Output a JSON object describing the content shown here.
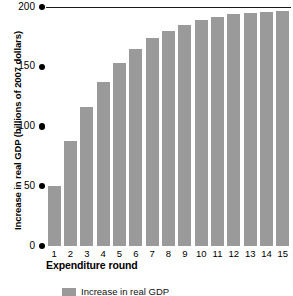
{
  "chart_data": {
    "type": "bar",
    "title": "",
    "xlabel": "Expenditure round",
    "ylabel": "Increase in real GDP (billions of 2007 dollars)",
    "categories": [
      "1",
      "2",
      "3",
      "4",
      "5",
      "6",
      "7",
      "8",
      "9",
      "10",
      "11",
      "12",
      "13",
      "14",
      "15"
    ],
    "values": [
      50,
      88,
      116,
      137,
      153,
      165,
      174,
      180,
      185,
      189,
      192,
      194,
      195,
      196,
      197
    ],
    "ylim": [
      0,
      200
    ],
    "yticks": [
      0,
      50,
      100,
      150,
      200
    ],
    "ytick_labels": [
      "0",
      "50",
      "100",
      "150",
      "200"
    ],
    "grid": false,
    "legend_position": "bottom",
    "annotations": {
      "reference_line": {
        "value": 200,
        "label": ""
      }
    },
    "series": [
      {
        "name": "Increase in real GDP",
        "values": [
          50,
          88,
          116,
          137,
          153,
          165,
          174,
          180,
          185,
          189,
          192,
          194,
          195,
          196,
          197
        ],
        "color": "#9a9a9a"
      }
    ]
  },
  "legend": {
    "swatch_color": "#9a9a9a",
    "label": "Increase in real GDP"
  },
  "colors": {
    "bar": "#9a9a9a",
    "axis": "#000000",
    "reference_line": "#1a1a1a",
    "background": "#ffffff"
  }
}
